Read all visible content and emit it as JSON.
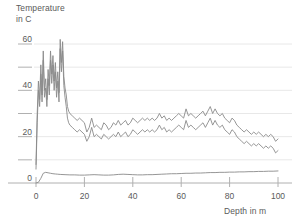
{
  "chart_data": {
    "type": "line",
    "title": "",
    "xlabel": "Depth in m",
    "ylabel": "Temperature in C",
    "ylabel_line1": "Temperature",
    "ylabel_line2": "in C",
    "xlim": [
      0,
      100
    ],
    "ylim": [
      0,
      65
    ],
    "grid": true,
    "grid_minor": true,
    "legend": "none",
    "x_ticks": [
      0,
      20,
      40,
      60,
      80,
      100
    ],
    "x_tick_labels": [
      "0",
      "20",
      "40",
      "60",
      "80",
      "100"
    ],
    "y_ticks": [
      0,
      20,
      40,
      60
    ],
    "y_tick_labels": [
      "0",
      "20",
      "40",
      "60"
    ],
    "y_minor_ticks": [
      10,
      30,
      50
    ],
    "gridline_values": [
      10,
      20,
      30,
      40,
      50,
      60
    ],
    "line_color": "#8a8a8a",
    "grid_color": "#e8e8e8",
    "axis_color": "#b0b0b0",
    "text_color": "#5a5a5a",
    "series": [
      {
        "name": "upper-temperature",
        "x": [
          0,
          0.5,
          1,
          1.5,
          2,
          2.5,
          3,
          3.5,
          4,
          4.5,
          5,
          5.5,
          6,
          6.5,
          7,
          7.5,
          8,
          8.5,
          9,
          9.5,
          10,
          10.5,
          11,
          11.5,
          12,
          12.5,
          13,
          13.5,
          14,
          15,
          16,
          17,
          18,
          19,
          20,
          21,
          22,
          23,
          24,
          25,
          26,
          27,
          28,
          29,
          30,
          31,
          32,
          33,
          34,
          35,
          36,
          37,
          38,
          39,
          40,
          41,
          42,
          43,
          44,
          45,
          46,
          47,
          48,
          49,
          50,
          51,
          52,
          53,
          54,
          55,
          56,
          57,
          58,
          59,
          60,
          61,
          62,
          63,
          64,
          65,
          66,
          67,
          68,
          69,
          70,
          71,
          72,
          73,
          74,
          75,
          76,
          77,
          78,
          79,
          80,
          81,
          82,
          83,
          84,
          85,
          86,
          87,
          88,
          89,
          90,
          91,
          92,
          93,
          94,
          95,
          96,
          97,
          98,
          99,
          100
        ],
        "values": [
          8,
          30,
          44,
          36,
          51,
          38,
          57,
          40,
          45,
          36,
          49,
          42,
          57,
          47,
          55,
          44,
          52,
          41,
          48,
          39,
          62,
          52,
          61,
          46,
          41,
          38,
          33,
          31,
          30,
          29,
          28,
          27,
          28,
          27,
          26,
          22,
          24,
          28,
          24,
          25,
          24,
          23,
          26,
          25,
          23,
          24,
          26,
          25,
          27,
          25,
          26,
          27,
          25,
          26,
          28,
          27,
          26,
          27,
          28,
          27,
          28,
          27,
          28,
          27,
          28,
          30,
          28,
          29,
          27,
          28,
          27,
          28,
          29,
          30,
          29,
          28,
          32,
          29,
          30,
          29,
          28,
          29,
          30,
          31,
          29,
          31,
          33,
          30,
          32,
          30,
          29,
          30,
          28,
          27,
          26,
          28,
          27,
          25,
          24,
          23,
          22,
          23,
          22,
          21,
          22,
          21,
          22,
          21,
          20,
          21,
          20,
          21,
          20,
          18,
          19
        ]
      },
      {
        "name": "lower-temperature",
        "x": [
          0,
          0.5,
          1,
          1.5,
          2,
          2.5,
          3,
          3.5,
          4,
          4.5,
          5,
          5.5,
          6,
          6.5,
          7,
          7.5,
          8,
          8.5,
          9,
          9.5,
          10,
          10.5,
          11,
          11.5,
          12,
          12.5,
          13,
          13.5,
          14,
          15,
          16,
          17,
          18,
          19,
          20,
          21,
          22,
          23,
          24,
          25,
          26,
          27,
          28,
          29,
          30,
          31,
          32,
          33,
          34,
          35,
          36,
          37,
          38,
          39,
          40,
          41,
          42,
          43,
          44,
          45,
          46,
          47,
          48,
          49,
          50,
          51,
          52,
          53,
          54,
          55,
          56,
          57,
          58,
          59,
          60,
          61,
          62,
          63,
          64,
          65,
          66,
          67,
          68,
          69,
          70,
          71,
          72,
          73,
          74,
          75,
          76,
          77,
          78,
          79,
          80,
          81,
          82,
          83,
          84,
          85,
          86,
          87,
          88,
          89,
          90,
          91,
          92,
          93,
          94,
          95,
          96,
          97,
          98,
          99,
          100
        ],
        "values": [
          6,
          26,
          40,
          33,
          47,
          35,
          53,
          37,
          41,
          33,
          45,
          38,
          53,
          43,
          51,
          40,
          48,
          37,
          44,
          35,
          58,
          48,
          57,
          42,
          37,
          33,
          28,
          26,
          25,
          24,
          23,
          22,
          23,
          22,
          21,
          18,
          20,
          24,
          20,
          21,
          20,
          19,
          21,
          20,
          19,
          20,
          21,
          20,
          22,
          20,
          21,
          22,
          20,
          21,
          23,
          22,
          21,
          22,
          23,
          22,
          23,
          22,
          23,
          22,
          23,
          25,
          23,
          24,
          22,
          23,
          22,
          23,
          24,
          25,
          24,
          23,
          27,
          24,
          25,
          24,
          23,
          24,
          25,
          26,
          24,
          26,
          28,
          25,
          27,
          25,
          24,
          25,
          23,
          22,
          21,
          23,
          22,
          20,
          19,
          18,
          17,
          18,
          17,
          16,
          17,
          16,
          17,
          16,
          15,
          16,
          15,
          16,
          15,
          13,
          14
        ]
      },
      {
        "name": "baseline-temperature",
        "x": [
          0,
          1,
          2,
          3,
          4,
          5,
          6,
          7,
          8,
          9,
          10,
          12,
          14,
          16,
          18,
          20,
          22,
          24,
          26,
          28,
          30,
          32,
          34,
          36,
          38,
          40,
          42,
          44,
          46,
          48,
          50,
          52,
          54,
          56,
          58,
          60,
          62,
          64,
          66,
          68,
          70,
          72,
          74,
          76,
          78,
          80,
          82,
          84,
          86,
          88,
          90,
          92,
          94,
          96,
          98,
          100
        ],
        "values": [
          0,
          0.3,
          2.0,
          4.2,
          4.6,
          4.4,
          4.2,
          4.0,
          3.9,
          3.8,
          3.7,
          3.6,
          3.5,
          3.5,
          3.4,
          3.4,
          3.5,
          3.6,
          3.5,
          3.4,
          3.4,
          3.5,
          3.7,
          3.8,
          3.7,
          3.6,
          3.5,
          3.5,
          3.6,
          3.6,
          3.7,
          3.8,
          3.9,
          4.0,
          4.0,
          4.1,
          4.2,
          4.2,
          4.3,
          4.3,
          4.4,
          4.5,
          4.5,
          4.6,
          4.6,
          4.7,
          4.7,
          4.8,
          4.8,
          4.9,
          4.9,
          5.0,
          5.0,
          5.1,
          5.1,
          5.2
        ]
      }
    ]
  }
}
